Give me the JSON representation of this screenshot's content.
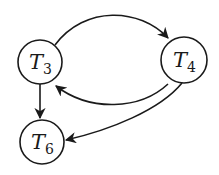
{
  "diagram": {
    "type": "directed-graph",
    "colors": {
      "stroke": "#1a1a1a",
      "background": "#ffffff"
    },
    "nodes": [
      {
        "id": "T3",
        "label": "T",
        "subscript": "3",
        "cx": 40,
        "cy": 62,
        "r": 22
      },
      {
        "id": "T4",
        "label": "T",
        "subscript": "4",
        "cx": 184,
        "cy": 60,
        "r": 23
      },
      {
        "id": "T6",
        "label": "T",
        "subscript": "6",
        "cx": 42,
        "cy": 142,
        "r": 22
      }
    ],
    "edges": [
      {
        "from": "T3",
        "to": "T4",
        "shape": "arc-over"
      },
      {
        "from": "T4",
        "to": "T3",
        "shape": "arc-under"
      },
      {
        "from": "T3",
        "to": "T6",
        "shape": "straight"
      },
      {
        "from": "T4",
        "to": "T6",
        "shape": "curve"
      }
    ]
  }
}
